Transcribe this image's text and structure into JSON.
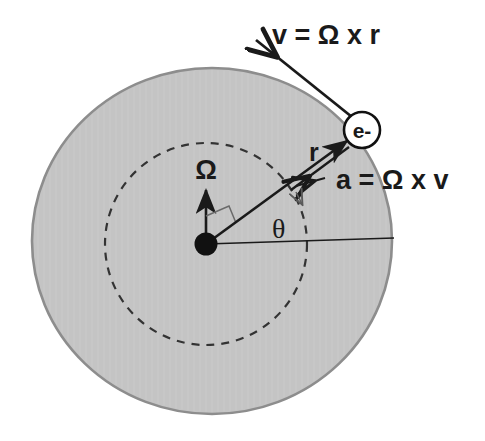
{
  "figure": {
    "background_color": "#ffffff",
    "disk_fill_color": "#c4c4c4",
    "disk_stroke_color": "#8a8a8a",
    "line_color": "#1a1a1a",
    "dashed_color": "#3a3a3a"
  },
  "labels": {
    "velocity": "v = Ω x r",
    "acceleration": "a = Ω x v",
    "radius": "r",
    "angle": "θ",
    "angular_velocity": "Ω",
    "particle": "e-"
  },
  "geometry": {
    "disk_center_x": 212,
    "disk_center_y": 241,
    "disk_radius_x": 181,
    "disk_radius_y": 174,
    "orbit_center_x": 206,
    "orbit_center_y": 244,
    "orbit_radius": 101,
    "origin_x": 206,
    "origin_y": 244,
    "origin_dot_radius": 11,
    "electron_x": 362,
    "electron_y": 130,
    "electron_radius": 18,
    "omega_arrow_tip_y": 184,
    "theta_degrees": 36
  },
  "elements": {
    "shaded_disk": "shaded-disk",
    "dashed_orbit": "dashed-orbit-circle",
    "origin_dot": "origin-dot",
    "omega_arrow": "omega-arrow",
    "right_angle_marker": "right-angle-marker",
    "radius_arrow": "radius-arrow",
    "acceleration_arrow": "acceleration-arrow",
    "velocity_arrow": "velocity-arrow",
    "reference_axis": "horizontal-reference-line",
    "electron_circle": "electron-circle"
  }
}
